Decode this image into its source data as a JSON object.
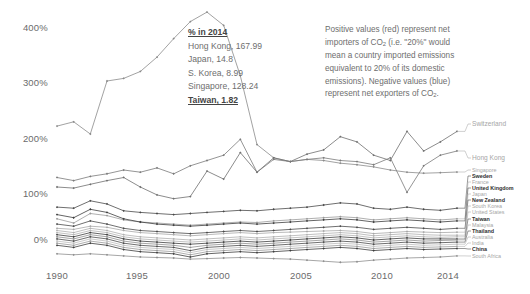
{
  "chart_data": {
    "type": "line",
    "title": "",
    "xlabel": "",
    "ylabel": "",
    "x": [
      1990,
      1991,
      1992,
      1993,
      1994,
      1995,
      1996,
      1997,
      1998,
      1999,
      2000,
      2001,
      2002,
      2003,
      2004,
      2005,
      2006,
      2007,
      2008,
      2009,
      2010,
      2011,
      2012,
      2013,
      2014
    ],
    "xticks": [
      "1990",
      "1995",
      "2000",
      "2005",
      "2010",
      "2014"
    ],
    "yticks": [
      "0%",
      "100%",
      "200%",
      "300%",
      "400%"
    ],
    "ylim": [
      -55,
      440
    ],
    "xlim": [
      1990,
      2014
    ],
    "grid": false,
    "legend_position": "right-edge-labels",
    "note": "Net CO2 trade balance as percent of domestic emissions, 1990-2014",
    "series": [
      {
        "name": "Singapore",
        "label_bold": false,
        "color": "#8a8a8a",
        "values": [
          215,
          223,
          200,
          300,
          305,
          318,
          345,
          380,
          412,
          430,
          405,
          310,
          180,
          155,
          148,
          152,
          150,
          145,
          142,
          138,
          132,
          128,
          126,
          127,
          128.24
        ]
      },
      {
        "name": "Switzerland",
        "label_bold": false,
        "color": "#6f6f6f",
        "values": [
          100,
          98,
          105,
          112,
          118,
          100,
          85,
          78,
          82,
          130,
          115,
          165,
          128,
          155,
          148,
          162,
          170,
          195,
          185,
          160,
          150,
          205,
          168,
          185,
          205
        ]
      },
      {
        "name": "Hong Kong",
        "label_bold": false,
        "color": "#7a7a7a",
        "values": [
          118,
          112,
          120,
          125,
          132,
          128,
          136,
          125,
          140,
          150,
          160,
          190,
          128,
          152,
          148,
          152,
          155,
          150,
          148,
          142,
          155,
          90,
          140,
          160,
          167.99
        ]
      },
      {
        "name": "Sweden",
        "label_bold": true,
        "color": "#4a4a4a",
        "values": [
          62,
          60,
          74,
          68,
          55,
          52,
          50,
          48,
          50,
          52,
          54,
          56,
          55,
          58,
          60,
          62,
          66,
          70,
          68,
          60,
          58,
          62,
          58,
          56,
          60
        ]
      },
      {
        "name": "France",
        "label_bold": false,
        "color": "#9a9a9a",
        "values": [
          40,
          32,
          50,
          46,
          38,
          34,
          32,
          30,
          28,
          30,
          32,
          34,
          33,
          36,
          38,
          40,
          42,
          44,
          42,
          38,
          40,
          42,
          40,
          38,
          40
        ]
      },
      {
        "name": "United Kingdom",
        "label_bold": true,
        "color": "#3d3d3d",
        "values": [
          48,
          42,
          58,
          52,
          40,
          34,
          30,
          28,
          26,
          28,
          30,
          32,
          30,
          32,
          34,
          36,
          38,
          40,
          38,
          34,
          36,
          38,
          36,
          34,
          36
        ]
      },
      {
        "name": "Japan",
        "label_bold": false,
        "color": "#a8a8a8",
        "values": [
          22,
          20,
          26,
          24,
          18,
          14,
          12,
          10,
          8,
          10,
          12,
          14,
          12,
          14,
          15,
          16,
          17,
          18,
          16,
          12,
          14,
          16,
          15,
          14,
          14.8
        ]
      },
      {
        "name": "New Zealand",
        "label_bold": true,
        "color": "#4a4a4a",
        "values": [
          30,
          26,
          36,
          30,
          22,
          18,
          16,
          14,
          12,
          14,
          16,
          18,
          16,
          18,
          20,
          22,
          24,
          26,
          24,
          20,
          22,
          24,
          22,
          20,
          22
        ]
      },
      {
        "name": "S. Korea",
        "label_bold": false,
        "color": "#b0b0b0",
        "values": [
          18,
          14,
          22,
          18,
          10,
          6,
          4,
          2,
          0,
          2,
          4,
          6,
          4,
          6,
          8,
          10,
          12,
          14,
          12,
          8,
          10,
          12,
          10,
          9,
          8.99
        ]
      },
      {
        "name": "United States",
        "label_bold": false,
        "color": "#b4b4b4",
        "values": [
          14,
          10,
          18,
          14,
          6,
          2,
          0,
          -2,
          -4,
          -2,
          0,
          2,
          0,
          2,
          4,
          6,
          8,
          10,
          8,
          4,
          6,
          8,
          6,
          5,
          6
        ]
      },
      {
        "name": "Taiwan",
        "label_bold": true,
        "color": "#3d3d3d",
        "values": [
          10,
          6,
          14,
          10,
          2,
          -2,
          -4,
          -6,
          -8,
          -6,
          -4,
          -2,
          -4,
          -2,
          0,
          2,
          4,
          6,
          4,
          0,
          2,
          4,
          2,
          2,
          1.82
        ]
      },
      {
        "name": "Malaysia",
        "label_bold": false,
        "color": "#8f8f8f",
        "values": [
          6,
          2,
          10,
          6,
          -2,
          -6,
          -8,
          -10,
          -14,
          -10,
          -8,
          -6,
          -8,
          -6,
          -4,
          -2,
          0,
          2,
          0,
          -4,
          -2,
          0,
          -2,
          -1,
          0
        ]
      },
      {
        "name": "Thailand",
        "label_bold": true,
        "color": "#4a4a4a",
        "values": [
          2,
          -2,
          6,
          2,
          -6,
          -10,
          -12,
          -14,
          -20,
          -14,
          -12,
          -10,
          -12,
          -10,
          -8,
          -6,
          -4,
          -2,
          -4,
          -8,
          -6,
          -4,
          -6,
          -5,
          -4
        ]
      },
      {
        "name": "Australia",
        "label_bold": false,
        "color": "#bcbcbc",
        "values": [
          -2,
          -6,
          2,
          -2,
          -10,
          -14,
          -16,
          -18,
          -24,
          -18,
          -16,
          -14,
          -16,
          -14,
          -12,
          -10,
          -8,
          -6,
          -8,
          -12,
          -10,
          -8,
          -10,
          -9,
          -8
        ]
      },
      {
        "name": "India",
        "label_bold": false,
        "color": "#9a9a9a",
        "values": [
          -6,
          -10,
          -2,
          -6,
          -14,
          -18,
          -20,
          -22,
          -28,
          -22,
          -20,
          -18,
          -20,
          -18,
          -16,
          -14,
          -12,
          -10,
          -12,
          -16,
          -14,
          -12,
          -14,
          -13,
          -12
        ]
      },
      {
        "name": "China",
        "label_bold": true,
        "color": "#3d3d3d",
        "values": [
          -10,
          -14,
          -6,
          -10,
          -18,
          -22,
          -24,
          -26,
          -32,
          -26,
          -24,
          -22,
          -24,
          -22,
          -20,
          -18,
          -16,
          -14,
          -16,
          -20,
          -18,
          -16,
          -18,
          -17,
          -16
        ]
      },
      {
        "name": "South Africa",
        "label_bold": false,
        "color": "#8f8f8f",
        "values": [
          -26,
          -28,
          -26,
          -28,
          -30,
          -32,
          -33,
          -34,
          -36,
          -35,
          -34,
          -33,
          -34,
          -35,
          -36,
          -38,
          -40,
          -42,
          -41,
          -38,
          -36,
          -34,
          -33,
          -32,
          -30
        ]
      }
    ]
  },
  "annotation_box": {
    "heading": "% in 2014",
    "lines": [
      "Hong Kong, 167.99",
      "Japan, 14.8",
      "S. Korea, 8.99",
      "Singapore, 128.24"
    ],
    "emphasis_line": "Taiwan, 1.82"
  },
  "description": {
    "lines": [
      "Positive values (red) represent net",
      "importers of CO₂ (i.e. \"20%\" would",
      "mean a country imported emissions",
      "equivalent to 20% of its domestic",
      "emissions). Negative values (blue)",
      "represent net exporters of CO₂."
    ]
  },
  "edge_labels": [
    {
      "name": "Switzerland",
      "bold": false
    },
    {
      "name": "Hong Kong",
      "bold": false
    },
    {
      "name": "Singapore",
      "bold": false
    },
    {
      "name": "Sweden",
      "bold": true
    },
    {
      "name": "France",
      "bold": false
    },
    {
      "name": "United Kingdom",
      "bold": true
    },
    {
      "name": "Japan",
      "bold": false
    },
    {
      "name": "New Zealand",
      "bold": true
    },
    {
      "name": "South Korea",
      "bold": false
    },
    {
      "name": "United States",
      "bold": false
    },
    {
      "name": "Taiwan",
      "bold": true
    },
    {
      "name": "Malaysia",
      "bold": false
    },
    {
      "name": "Thailand",
      "bold": true
    },
    {
      "name": "Australia",
      "bold": false
    },
    {
      "name": "India",
      "bold": false
    },
    {
      "name": "China",
      "bold": true
    },
    {
      "name": "South Africa",
      "bold": false
    }
  ]
}
